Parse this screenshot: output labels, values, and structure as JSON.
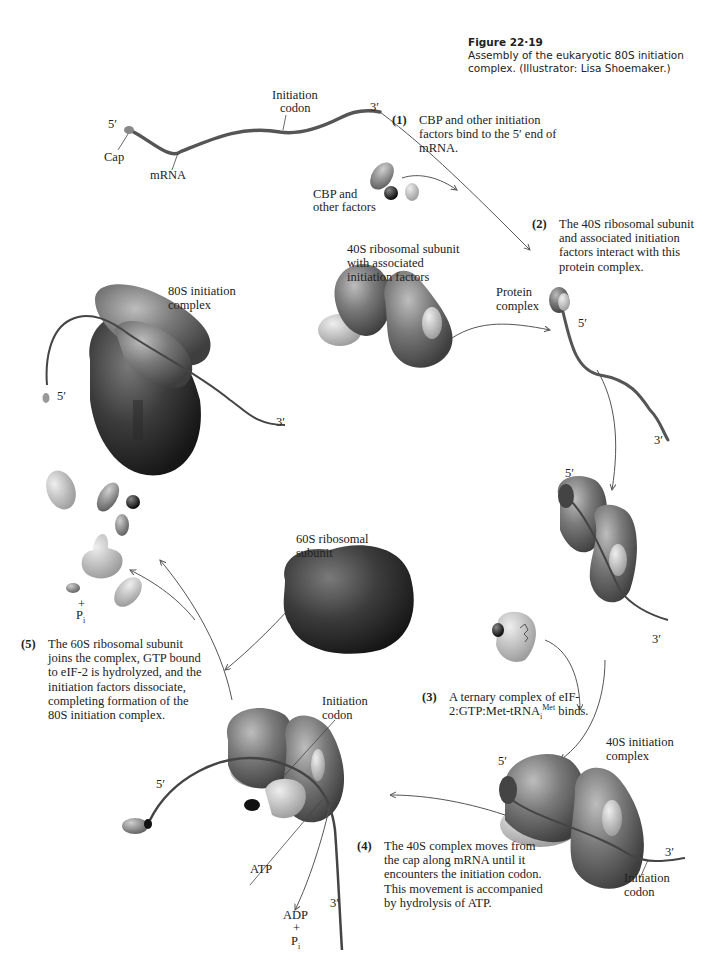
{
  "caption": {
    "figure_number": "Figure 22·19",
    "text": "Assembly of the eukaryotic 80S initiation complex. (Illustrator: Lisa Shoemaker.)"
  },
  "labels": {
    "cap": "Cap",
    "five_prime": "5′",
    "three_prime": "3′",
    "mrna": "mRNA",
    "initiation_codon_line1": "Initiation",
    "initiation_codon_line2": "codon",
    "cbp_line1": "CBP and",
    "cbp_line2": "other factors",
    "s40_line1": "40S ribosomal subunit",
    "s40_line2": "with associated",
    "s40_line3": "initiation factors",
    "protein_complex_line1": "Protein",
    "protein_complex_line2": "complex",
    "s80_line1": "80S initiation",
    "s80_line2": "complex",
    "s60_line1": "60S ribosomal",
    "s60_line2": "subunit",
    "s40_init_line1": "40S initiation",
    "s40_init_line2": "complex",
    "atp": "ATP",
    "adp": "ADP",
    "plus": "+",
    "pi": "P",
    "pi_sub": "i"
  },
  "steps": [
    {
      "num": "(1)",
      "text": "CBP and other initiation factors bind to the 5′ end of mRNA."
    },
    {
      "num": "(2)",
      "text": "The 40S ribosomal subunit and associated initiation factors interact with this protein complex."
    },
    {
      "num": "(3)",
      "text_a": "A ternary complex of eIF-2:GTP:Met-tRNA",
      "sub": "i",
      "sup": "Met",
      "text_b": " binds."
    },
    {
      "num": "(4)",
      "text": "The 40S complex moves from the cap along mRNA until it encounters the initiation codon. This movement is accompanied by hydrolysis of ATP."
    },
    {
      "num": "(5)",
      "text": "The 60S ribosomal subunit joins the complex, GTP bound to eIF-2 is hydrolyzed, and the initiation factors dissociate, completing formation of the 80S initiation complex."
    }
  ],
  "colors": {
    "ribosome_40s": "#6e6e6e",
    "ribosome_60s": "#3a3a3a",
    "factor_light": "#bdbdbd",
    "factor_mid": "#8a8a8a",
    "factor_dark": "#1c1c1c",
    "mrna": "#5a5a5a",
    "arrow": "#555555"
  }
}
